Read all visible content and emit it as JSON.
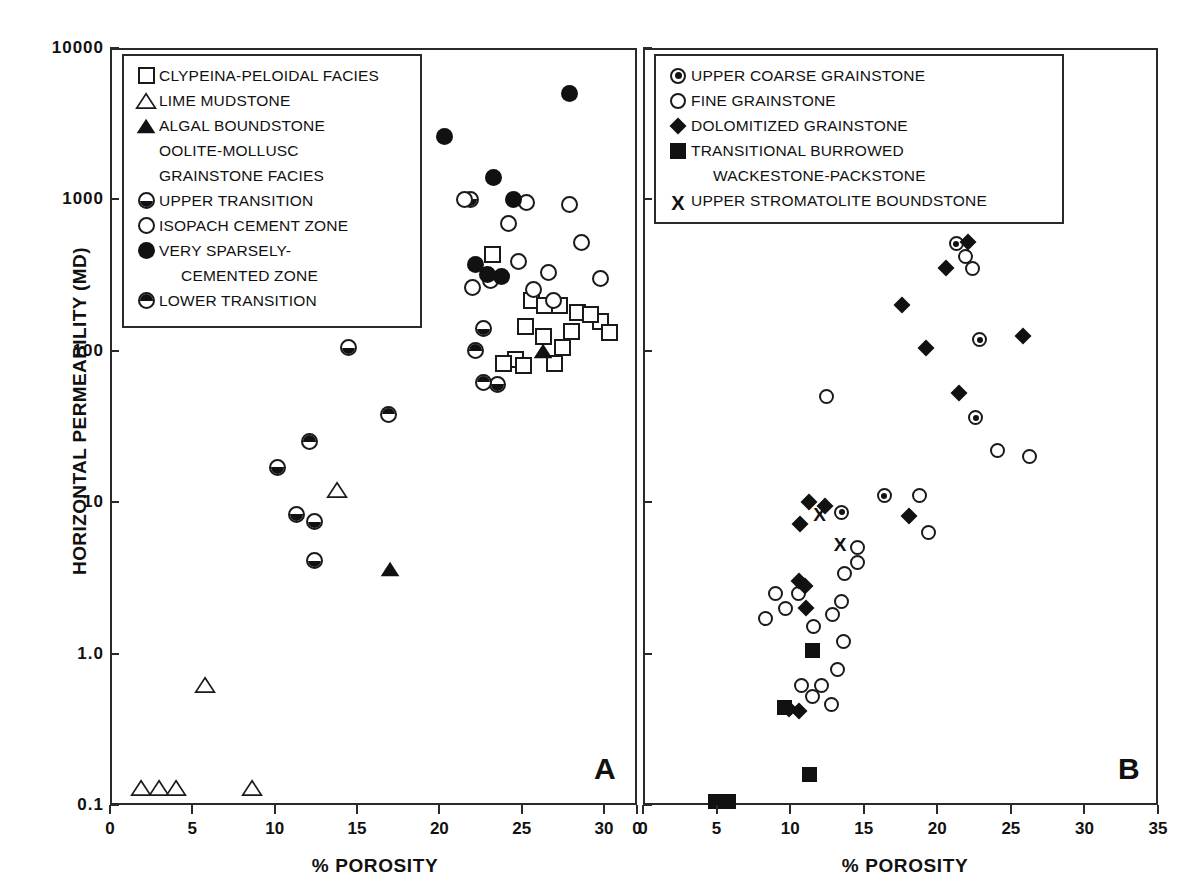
{
  "figure": {
    "ylabel": "HORIZONTAL PERMEABILITY (MD)",
    "panelA_letter": "A",
    "panelB_letter": "B",
    "xlabelA": "% POROSITY",
    "xlabelB": "% POROSITY",
    "yticklabels": [
      "10000",
      "1000",
      "100",
      "10",
      "1.0",
      "0.1"
    ],
    "xticklabelsA": [
      "0",
      "5",
      "10",
      "15",
      "20",
      "25",
      "30",
      "0"
    ],
    "xticklabelsB": [
      "0",
      "5",
      "10",
      "15",
      "20",
      "25",
      "30",
      "35"
    ]
  },
  "legendA": {
    "rows": [
      {
        "symbol": "square-open-icon",
        "label": "CLYPEINA-PELOIDAL FACIES",
        "indent": false
      },
      {
        "symbol": "triangle-open-icon",
        "label": "LIME MUDSTONE",
        "indent": false
      },
      {
        "symbol": "triangle-filled-icon",
        "label": "ALGAL BOUNDSTONE",
        "indent": false
      },
      {
        "symbol": "none",
        "label": "OOLITE-MOLLUSC",
        "indent": false
      },
      {
        "symbol": "none",
        "label": "GRAINSTONE FACIES",
        "indent": false
      },
      {
        "symbol": "circle-half-bottom-icon",
        "label": "UPPER TRANSITION",
        "indent": false
      },
      {
        "symbol": "circle-open-icon",
        "label": "ISOPACH  CEMENT ZONE",
        "indent": false
      },
      {
        "symbol": "circle-filled-icon",
        "label": "VERY SPARSELY-",
        "indent": false
      },
      {
        "symbol": "none",
        "label": "CEMENTED ZONE",
        "indent": true
      },
      {
        "symbol": "circle-half-top-icon",
        "label": "LOWER TRANSITION",
        "indent": false
      }
    ]
  },
  "legendB": {
    "rows": [
      {
        "symbol": "bullseye-icon",
        "label": "UPPER COARSE GRAINSTONE",
        "indent": false
      },
      {
        "symbol": "circle-open-icon",
        "label": "FINE GRAINSTONE",
        "indent": false
      },
      {
        "symbol": "diamond-filled-icon",
        "label": "DOLOMITIZED GRAINSTONE",
        "indent": false
      },
      {
        "symbol": "square-filled-icon",
        "label": "TRANSITIONAL BURROWED",
        "indent": false
      },
      {
        "symbol": "none",
        "label": "WACKESTONE-PACKSTONE",
        "indent": true
      },
      {
        "symbol": "x-mark-icon",
        "label": "UPPER STROMATOLITE BOUNDSTONE",
        "indent": false
      }
    ]
  },
  "chart_data": [
    {
      "type": "scatter",
      "panel": "A",
      "title": "A",
      "xlabel": "% POROSITY",
      "ylabel": "HORIZONTAL PERMEABILITY (MD)",
      "xlim": [
        0,
        32
      ],
      "ylim": [
        0.1,
        10000
      ],
      "yscale": "log",
      "xticks": [
        0,
        5,
        10,
        15,
        20,
        25,
        30
      ],
      "yticks": [
        0.1,
        1.0,
        10,
        100,
        1000,
        10000
      ],
      "grid": false,
      "legend_position": "top-left-inside",
      "series": [
        {
          "name": "CLYPEINA-PELOIDAL FACIES",
          "marker": "square-open",
          "points": [
            [
              23.2,
              430
            ],
            [
              25.6,
              215
            ],
            [
              26.4,
              200
            ],
            [
              27.3,
              200
            ],
            [
              28.4,
              180
            ],
            [
              29.8,
              155
            ],
            [
              28.0,
              135
            ],
            [
              30.3,
              132
            ],
            [
              25.2,
              145
            ],
            [
              24.6,
              88
            ],
            [
              26.3,
              125
            ],
            [
              27.5,
              105
            ],
            [
              25.1,
              80
            ],
            [
              23.9,
              83
            ],
            [
              27.0,
              82
            ],
            [
              29.2,
              175
            ]
          ]
        },
        {
          "name": "LIME MUDSTONE",
          "marker": "triangle-open",
          "points": [
            [
              13.8,
              12
            ],
            [
              5.8,
              0.62
            ],
            [
              1.9,
              0.13
            ],
            [
              3.0,
              0.13
            ],
            [
              4.0,
              0.13
            ],
            [
              8.6,
              0.13
            ]
          ]
        },
        {
          "name": "ALGAL BOUNDSTONE",
          "marker": "triangle-filled",
          "points": [
            [
              26.3,
              100
            ],
            [
              17.0,
              3.6
            ]
          ]
        },
        {
          "name": "UPPER TRANSITION",
          "marker": "circle-half-bottom",
          "points": [
            [
              21.9,
              1000
            ],
            [
              14.5,
              105
            ],
            [
              10.2,
              17
            ],
            [
              11.3,
              8.3
            ],
            [
              12.4,
              7.4
            ],
            [
              12.4,
              4.1
            ],
            [
              22.7,
              140
            ],
            [
              23.5,
              60
            ]
          ]
        },
        {
          "name": "ISOPACH CEMENT ZONE",
          "marker": "circle-open",
          "points": [
            [
              21.5,
              1000
            ],
            [
              25.3,
              950
            ],
            [
              27.9,
              930
            ],
            [
              24.2,
              690
            ],
            [
              28.6,
              520
            ],
            [
              24.8,
              390
            ],
            [
              26.6,
              330
            ],
            [
              29.8,
              300
            ],
            [
              23.1,
              290
            ],
            [
              25.7,
              255
            ],
            [
              26.9,
              215
            ],
            [
              22.0,
              260
            ]
          ]
        },
        {
          "name": "VERY SPARSELY-CEMENTED ZONE",
          "marker": "circle-filled",
          "points": [
            [
              27.9,
              5000
            ],
            [
              20.3,
              2600
            ],
            [
              23.3,
              1400
            ],
            [
              24.5,
              1000
            ],
            [
              22.2,
              370
            ],
            [
              22.9,
              320
            ],
            [
              23.8,
              310
            ]
          ]
        },
        {
          "name": "LOWER TRANSITION",
          "marker": "circle-half-top",
          "points": [
            [
              12.1,
              25
            ],
            [
              22.2,
              100
            ],
            [
              22.7,
              62
            ],
            [
              16.9,
              38
            ]
          ]
        }
      ]
    },
    {
      "type": "scatter",
      "panel": "B",
      "title": "B",
      "xlabel": "% POROSITY",
      "ylabel": "HORIZONTAL PERMEABILITY (MD)",
      "xlim": [
        0,
        35
      ],
      "ylim": [
        0.1,
        10000
      ],
      "yscale": "log",
      "xticks": [
        0,
        5,
        10,
        15,
        20,
        25,
        30,
        35
      ],
      "yticks": [
        0.1,
        1.0,
        10,
        100,
        1000,
        10000
      ],
      "grid": false,
      "legend_position": "top-right-inside",
      "series": [
        {
          "name": "UPPER COARSE GRAINSTONE",
          "marker": "bullseye",
          "points": [
            [
              21.3,
              510
            ],
            [
              22.9,
              118
            ],
            [
              22.6,
              36
            ],
            [
              16.4,
              11
            ],
            [
              13.5,
              8.6
            ]
          ]
        },
        {
          "name": "FINE GRAINSTONE",
          "marker": "circle-open",
          "points": [
            [
              21.9,
              420
            ],
            [
              22.4,
              350
            ],
            [
              12.5,
              50
            ],
            [
              24.1,
              22
            ],
            [
              26.3,
              20
            ],
            [
              18.8,
              11
            ],
            [
              19.4,
              6.3
            ],
            [
              14.6,
              5.0
            ],
            [
              14.6,
              4.0
            ],
            [
              13.7,
              3.4
            ],
            [
              13.5,
              2.2
            ],
            [
              12.9,
              1.8
            ],
            [
              13.6,
              1.2
            ],
            [
              13.2,
              0.78
            ],
            [
              9.0,
              2.5
            ],
            [
              9.7,
              2.0
            ],
            [
              8.3,
              1.7
            ],
            [
              10.6,
              2.5
            ],
            [
              11.6,
              1.5
            ],
            [
              12.1,
              0.62
            ],
            [
              12.8,
              0.46
            ],
            [
              10.8,
              0.62
            ],
            [
              11.5,
              0.52
            ]
          ]
        },
        {
          "name": "DOLOMITIZED GRAINSTONE",
          "marker": "diamond-filled",
          "points": [
            [
              22.1,
              520
            ],
            [
              20.6,
              350
            ],
            [
              17.6,
              200
            ],
            [
              25.8,
              125
            ],
            [
              19.2,
              105
            ],
            [
              21.5,
              53
            ],
            [
              18.1,
              8.1
            ],
            [
              11.3,
              10
            ],
            [
              12.4,
              9.4
            ],
            [
              10.7,
              7.2
            ],
            [
              10.6,
              3.0
            ],
            [
              11.0,
              2.8
            ],
            [
              11.1,
              2.0
            ],
            [
              9.9,
              0.43
            ],
            [
              10.6,
              0.42
            ]
          ]
        },
        {
          "name": "TRANSITIONAL BURROWED WACKESTONE-PACKSTONE",
          "marker": "square-filled",
          "points": [
            [
              11.5,
              1.05
            ],
            [
              9.6,
              0.44
            ],
            [
              11.3,
              0.16
            ],
            [
              4.9,
              0.105
            ],
            [
              5.8,
              0.105
            ]
          ]
        },
        {
          "name": "UPPER STROMATOLITE BOUNDSTONE",
          "marker": "x-mark",
          "points": [
            [
              12.0,
              8.6
            ],
            [
              13.4,
              5.4
            ]
          ]
        }
      ]
    }
  ]
}
